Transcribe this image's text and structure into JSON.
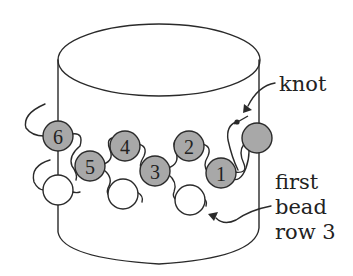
{
  "diagram": {
    "type": "beading-stitch-illustration",
    "colors": {
      "line": "#2a2a2a",
      "gray_bead": "#a8a8a8",
      "white_bead": "#ffffff",
      "background": "#ffffff"
    },
    "labels": {
      "knot": "knot",
      "first_bead_line1": "first",
      "first_bead_line2": "bead",
      "first_bead_line3": "row 3"
    },
    "numbered_beads": [
      {
        "num": "6"
      },
      {
        "num": "5"
      },
      {
        "num": "4"
      },
      {
        "num": "3"
      },
      {
        "num": "2"
      },
      {
        "num": "1"
      }
    ]
  }
}
